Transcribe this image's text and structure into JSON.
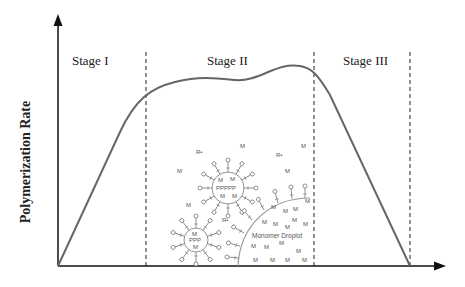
{
  "diagram": {
    "y_axis_label": "Polymerization Rate",
    "stages": [
      {
        "label": "Stage I"
      },
      {
        "label": "Stage II"
      },
      {
        "label": "Stage III"
      }
    ],
    "droplet_label": "Monomer Droplot",
    "micelle_large_core": "PPPPP",
    "micelle_small_core": "PPP",
    "monomer_symbol": "M",
    "radical_symbol": "R•",
    "colors": {
      "axis": "#111111",
      "curve": "#666666",
      "dashes": "#222222",
      "glyphs": "#777777"
    }
  }
}
